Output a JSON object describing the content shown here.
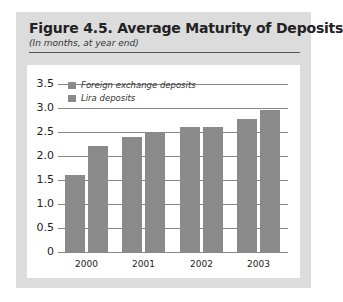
{
  "header": {
    "title": "Figure 4.5.  Average Maturity of Deposits",
    "subtitle": "(In months, at year end)"
  },
  "legend": [
    {
      "label": "Foreign exchange deposits"
    },
    {
      "label": "Lira deposits"
    }
  ],
  "y_ticks": [
    "3.5",
    "3.0",
    "2.5",
    "2.0",
    "1.5",
    "1.0",
    "0.5",
    "0"
  ],
  "x_ticks": [
    "2000",
    "2001",
    "2002",
    "2003"
  ],
  "colors": {
    "bar": "#8a8a8a",
    "panel": "#dcdcdc"
  },
  "chart_data": {
    "type": "bar",
    "title": "Figure 4.5.  Average Maturity of Deposits",
    "subtitle": "(In months, at year end)",
    "xlabel": "",
    "ylabel": "",
    "categories": [
      "2000",
      "2001",
      "2002",
      "2003"
    ],
    "series": [
      {
        "name": "Foreign exchange deposits",
        "values": [
          1.6,
          2.4,
          2.6,
          2.78
        ]
      },
      {
        "name": "Lira deposits",
        "values": [
          2.2,
          2.5,
          2.6,
          2.95
        ]
      }
    ],
    "ylim": [
      0,
      3.5
    ],
    "yticks": [
      0,
      0.5,
      1.0,
      1.5,
      2.0,
      2.5,
      3.0,
      3.5
    ],
    "grid": true,
    "legend_position": "top-left"
  }
}
